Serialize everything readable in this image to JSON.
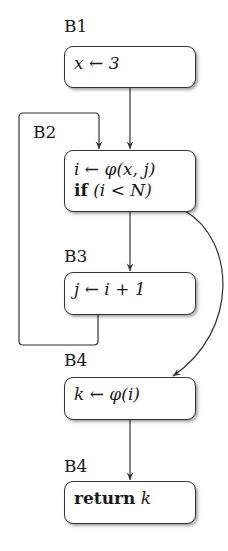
{
  "diagram": {
    "type": "control-flow-graph",
    "blocks": [
      {
        "id": "B1",
        "label": "B1",
        "lines": [
          "x ← 3"
        ]
      },
      {
        "id": "B2",
        "label": "B2",
        "lines": [
          "i ← φ(x, j)",
          "if (i < N)"
        ]
      },
      {
        "id": "B3",
        "label": "B3",
        "lines": [
          "j ← i + 1"
        ]
      },
      {
        "id": "B4a",
        "label": "B4",
        "lines": [
          "k ← φ(i)"
        ]
      },
      {
        "id": "B4b",
        "label": "B4",
        "lines": [
          "return k"
        ]
      }
    ],
    "edges": [
      {
        "from": "B1",
        "to": "B2",
        "kind": "straight"
      },
      {
        "from": "B2",
        "to": "B3",
        "kind": "straight"
      },
      {
        "from": "B3",
        "to": "B2",
        "kind": "loop-back"
      },
      {
        "from": "B2",
        "to": "B4a",
        "kind": "curved"
      },
      {
        "from": "B4a",
        "to": "B4b",
        "kind": "straight"
      }
    ],
    "colors": {
      "stroke": "#333333",
      "text": "#1a1a1a",
      "background": "#ffffff"
    }
  }
}
